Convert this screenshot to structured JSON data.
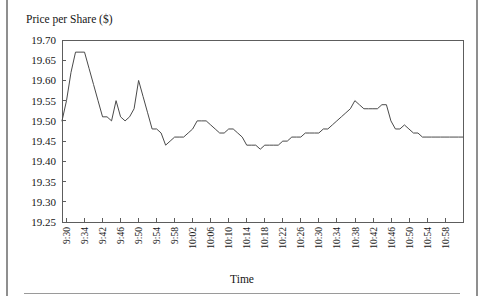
{
  "figure": {
    "ylabel": "Price per Share ($)",
    "xlabel": "Time"
  },
  "chart_data": {
    "type": "line",
    "title": "",
    "xlabel": "Time",
    "ylabel": "Price per Share ($)",
    "ylim": [
      19.25,
      19.7
    ],
    "ytick_labels": [
      "19.70",
      "19.65",
      "19.60",
      "19.55",
      "19.50",
      "19.45",
      "19.40",
      "19.35",
      "19.30",
      "19.25"
    ],
    "ytick_values": [
      19.7,
      19.65,
      19.6,
      19.55,
      19.5,
      19.45,
      19.4,
      19.35,
      19.3,
      19.25
    ],
    "xtick_labels": [
      "9:30",
      "9:34",
      "9:42",
      "9:46",
      "9:50",
      "9:54",
      "9:58",
      "10:02",
      "10:06",
      "10:10",
      "10:14",
      "10:18",
      "10:22",
      "10:26",
      "10:30",
      "10:34",
      "10:38",
      "10:42",
      "10:46",
      "10:50",
      "10:54",
      "10:58"
    ],
    "grid": false,
    "legend": false,
    "series": [
      {
        "name": "Price per Share",
        "x": [
          "9:30",
          "9:31",
          "9:32",
          "9:33",
          "9:34",
          "9:35",
          "9:36",
          "9:37",
          "9:38",
          "9:39",
          "9:40",
          "9:41",
          "9:42",
          "9:43",
          "9:44",
          "9:45",
          "9:46",
          "9:47",
          "9:48",
          "9:49",
          "9:50",
          "9:51",
          "9:52",
          "9:53",
          "9:54",
          "9:55",
          "9:56",
          "9:57",
          "9:58",
          "9:59",
          "10:00",
          "10:01",
          "10:02",
          "10:03",
          "10:04",
          "10:05",
          "10:06",
          "10:07",
          "10:08",
          "10:09",
          "10:10",
          "10:11",
          "10:12",
          "10:13",
          "10:14",
          "10:15",
          "10:16",
          "10:17",
          "10:18",
          "10:19",
          "10:20",
          "10:21",
          "10:22",
          "10:23",
          "10:24",
          "10:25",
          "10:26",
          "10:27",
          "10:28",
          "10:29",
          "10:30",
          "10:31",
          "10:32",
          "10:33",
          "10:34",
          "10:35",
          "10:36",
          "10:37",
          "10:38",
          "10:39",
          "10:40",
          "10:41",
          "10:42",
          "10:43",
          "10:44",
          "10:45",
          "10:46",
          "10:47",
          "10:48",
          "10:49",
          "10:50",
          "10:51",
          "10:52",
          "10:53",
          "10:54",
          "10:55",
          "10:56",
          "10:57",
          "10:58",
          "10:59"
        ],
        "values": [
          19.5,
          19.55,
          19.62,
          19.67,
          19.67,
          19.67,
          19.63,
          19.59,
          19.55,
          19.51,
          19.51,
          19.5,
          19.55,
          19.51,
          19.5,
          19.51,
          19.53,
          19.6,
          19.56,
          19.52,
          19.48,
          19.48,
          19.47,
          19.44,
          19.45,
          19.46,
          19.46,
          19.46,
          19.47,
          19.48,
          19.5,
          19.5,
          19.5,
          19.49,
          19.48,
          19.47,
          19.47,
          19.48,
          19.48,
          19.47,
          19.46,
          19.44,
          19.44,
          19.44,
          19.43,
          19.44,
          19.44,
          19.44,
          19.44,
          19.45,
          19.45,
          19.46,
          19.46,
          19.46,
          19.47,
          19.47,
          19.47,
          19.47,
          19.48,
          19.48,
          19.49,
          19.5,
          19.51,
          19.52,
          19.53,
          19.55,
          19.54,
          19.53,
          19.53,
          19.53,
          19.53,
          19.54,
          19.54,
          19.5,
          19.48,
          19.48,
          19.49,
          19.48,
          19.47,
          19.47,
          19.46,
          19.46,
          19.46,
          19.46,
          19.46,
          19.46,
          19.46,
          19.46,
          19.46,
          19.46
        ]
      }
    ]
  }
}
